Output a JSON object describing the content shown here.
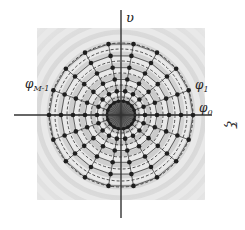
{
  "figure": {
    "axes": {
      "horizontal_label": "ξ",
      "vertical_label": "υ"
    },
    "angle_labels": {
      "phi_0": {
        "base": "φ",
        "sub": "0"
      },
      "phi_1": {
        "base": "φ",
        "sub": "1"
      },
      "phi_last": {
        "base": "φ",
        "sub": "M-1"
      }
    },
    "grid": {
      "center": [
        121,
        115
      ],
      "num_spokes": 18,
      "spoke_angle_step_deg": 20,
      "ring_radii": [
        12,
        24,
        36,
        48,
        60,
        72
      ],
      "dashed_rings": [
        18,
        30,
        42,
        54,
        66
      ],
      "inner_dense_radius": 10
    },
    "colors": {
      "background_ring_light": "#eeeeee",
      "background_ring_dark": "#cfcfcf",
      "line": "#2a2a2a",
      "dot": "#1e1e1e",
      "axis": "#333333"
    }
  }
}
